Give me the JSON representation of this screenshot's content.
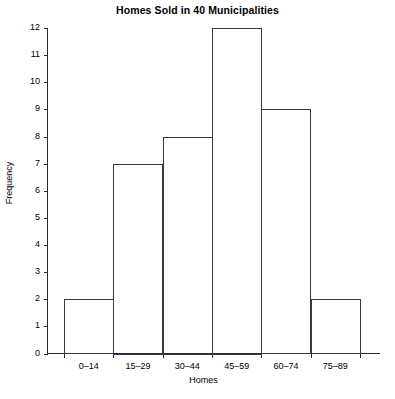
{
  "chart_data": {
    "type": "bar",
    "title": "Homes Sold in 40 Municipalities",
    "xlabel": "Homes",
    "ylabel": "Frequency",
    "categories": [
      "0–14",
      "15–29",
      "30–44",
      "45–59",
      "60–74",
      "75–89"
    ],
    "values": [
      2,
      7,
      8,
      12,
      9,
      2
    ],
    "ylim": [
      0,
      12
    ],
    "ytick_labels": [
      "0",
      "1",
      "2",
      "3",
      "4",
      "5",
      "6",
      "7",
      "8",
      "9",
      "10",
      "11",
      "12"
    ],
    "ytick_values": [
      0,
      1,
      2,
      3,
      4,
      5,
      6,
      7,
      8,
      9,
      10,
      11,
      12
    ],
    "grid": false,
    "legend": null,
    "bar_style": {
      "fill": "#ffffff",
      "stroke": "#3a3a3a"
    },
    "axis_color": "#2b2b2b",
    "background": "#ffffff"
  }
}
